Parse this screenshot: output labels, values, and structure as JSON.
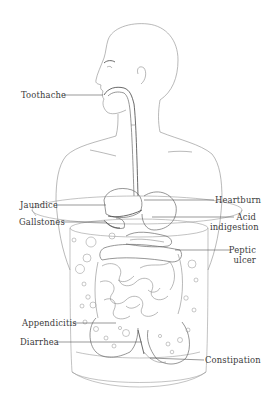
{
  "diagram": {
    "labels_left": [
      {
        "id": "toothache",
        "text": "Toothache"
      },
      {
        "id": "jaundice",
        "text": "Jaundice"
      },
      {
        "id": "gallstones",
        "text": "Gallstones"
      },
      {
        "id": "appendicitis",
        "text": "Appendicitis"
      },
      {
        "id": "diarrhea",
        "text": "Diarrhea"
      }
    ],
    "labels_right": [
      {
        "id": "heartburn",
        "text": "Heartburn"
      },
      {
        "id": "acid_indigestion",
        "lines": [
          "Acid",
          "indigestion"
        ]
      },
      {
        "id": "peptic_ulcer",
        "lines": [
          "Peptic",
          "ulcer"
        ]
      },
      {
        "id": "constipation",
        "text": "Constipation"
      }
    ],
    "colors": {
      "background": "#ffffff",
      "line_art": "#8a8a8a",
      "label_text": "#3a3a3a"
    }
  }
}
